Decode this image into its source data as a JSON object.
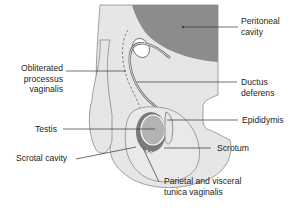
{
  "figure": {
    "colors": {
      "background": "#ffffff",
      "body_outline": "#8a8a8a",
      "body_fill": "#e6e6e6",
      "peritoneal_cavity": "#8c8c8c",
      "testis": "#b3b3b3",
      "tunica": "#7a7a7a",
      "scrotum_fill": "#e9e9e9",
      "leader_line": "#333333",
      "text": "#231f20"
    },
    "labels": {
      "peritoneal_cavity": [
        "Peritoneal",
        "cavity"
      ],
      "obliterated_processus": [
        "Obliterated",
        "processus",
        "vaginalis"
      ],
      "ductus_deferens": [
        "Ductus",
        "deferens"
      ],
      "testis": "Testis",
      "epididymis": "Epididymis",
      "scrotal_cavity": "Scrotal cavity",
      "scrotum": "Scrotum",
      "tunica_vaginalis": [
        "Parietal and visceral",
        "tunica vaginalis"
      ]
    }
  }
}
